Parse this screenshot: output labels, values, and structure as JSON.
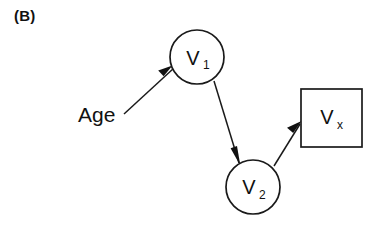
{
  "figure": {
    "panel_label": "(B)",
    "background_color": "#ffffff",
    "ink_color": "#111111"
  },
  "nodes": [
    {
      "id": "age",
      "kind": "text",
      "label": "Age",
      "subscript": "",
      "x": 78,
      "y": 122
    },
    {
      "id": "v1",
      "kind": "circle",
      "label": "V",
      "subscript": "1",
      "cx": 197,
      "cy": 57,
      "r": 27
    },
    {
      "id": "v2",
      "kind": "circle",
      "label": "V",
      "subscript": "2",
      "cx": 253,
      "cy": 187,
      "r": 27
    },
    {
      "id": "vx",
      "kind": "square",
      "label": "V",
      "subscript": "x",
      "x": 301,
      "y": 89,
      "width": 61,
      "height": 58
    }
  ],
  "edges": [
    {
      "id": "age-to-v1",
      "from": "Age",
      "to": "V1",
      "direction": "up-right"
    },
    {
      "id": "v1-to-v2",
      "from": "V1",
      "to": "V2",
      "direction": "down-right"
    },
    {
      "id": "v2-to-vx",
      "from": "V2",
      "to": "Vx",
      "direction": "up-right"
    }
  ]
}
